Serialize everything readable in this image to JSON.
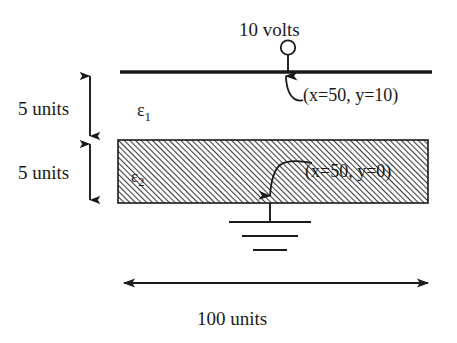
{
  "diagram": {
    "source_voltage_label": "10 volts",
    "top_electrode": {
      "name": "top-electrode-plate",
      "y_units": 10
    },
    "annotations": [
      {
        "id": "coord-top",
        "text": "(x=50, y=10)",
        "points_to": "top-electrode"
      },
      {
        "id": "coord-bottom",
        "text": "(x=50, y=0)",
        "points_to": "ground-node"
      }
    ],
    "regions": [
      {
        "id": "region-upper",
        "label": "ε",
        "subscript": "1",
        "fill": "white",
        "thickness_label": "5 units"
      },
      {
        "id": "region-lower",
        "label": "ε",
        "subscript": "2",
        "fill": "hatched",
        "thickness_label": "5 units"
      }
    ],
    "dimensions": [
      {
        "id": "dim-upper",
        "text": "5 units",
        "orientation": "vertical"
      },
      {
        "id": "dim-lower",
        "text": "5 units",
        "orientation": "vertical"
      },
      {
        "id": "dim-width",
        "text": "100 units",
        "orientation": "horizontal"
      }
    ],
    "ground": {
      "name": "ground-symbol",
      "bars": 3
    },
    "colors": {
      "stroke": "#1a1a1a",
      "hatch": "#3a3a3a",
      "hatch_background": "#ffffff",
      "background": "#ffffff"
    }
  }
}
